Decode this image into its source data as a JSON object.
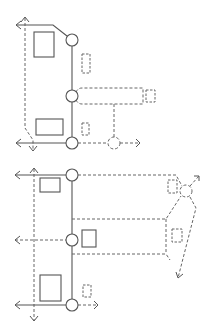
{
  "diagram": {
    "colors": {
      "background": "#ffffff",
      "stroke": "#555555",
      "dashed_stroke": "#666666"
    },
    "top_plan": {
      "nodes": [
        {
          "id": "t-node-1",
          "cx": 72,
          "cy": 40,
          "r": 6,
          "style": "solid"
        },
        {
          "id": "t-node-2",
          "cx": 72,
          "cy": 96,
          "r": 6,
          "style": "solid"
        },
        {
          "id": "t-node-3",
          "cx": 72,
          "cy": 143,
          "r": 6,
          "style": "solid"
        },
        {
          "id": "t-node-4",
          "cx": 114,
          "cy": 143,
          "r": 6,
          "style": "dashed"
        }
      ],
      "solid_boxes": [
        {
          "id": "t-box-1",
          "x": 34,
          "y": 32,
          "w": 20,
          "h": 25
        },
        {
          "id": "t-box-2",
          "x": 36,
          "y": 119,
          "w": 27,
          "h": 16
        }
      ],
      "dashed_boxes": [
        {
          "id": "t-dbox-1",
          "x": 82,
          "y": 54,
          "w": 8,
          "h": 19
        },
        {
          "id": "t-dbox-2",
          "x": 82,
          "y": 123,
          "w": 7,
          "h": 12
        },
        {
          "id": "t-dbox-3",
          "x": 146,
          "y": 90,
          "w": 9,
          "h": 12
        }
      ],
      "arrows": [
        "up",
        "left",
        "left",
        "down",
        "right"
      ]
    },
    "bottom_plan": {
      "nodes": [
        {
          "id": "b-node-1",
          "cx": 72,
          "cy": 175,
          "r": 6,
          "style": "solid"
        },
        {
          "id": "b-node-2",
          "cx": 72,
          "cy": 240,
          "r": 6,
          "style": "solid"
        },
        {
          "id": "b-node-3",
          "cx": 72,
          "cy": 305,
          "r": 6,
          "style": "solid"
        },
        {
          "id": "b-node-4",
          "cx": 186,
          "cy": 191,
          "r": 6,
          "style": "dashed"
        }
      ],
      "solid_boxes": [
        {
          "id": "b-box-1",
          "x": 40,
          "y": 178,
          "w": 20,
          "h": 14
        },
        {
          "id": "b-box-2",
          "x": 82,
          "y": 230,
          "w": 14,
          "h": 17
        },
        {
          "id": "b-box-3",
          "x": 40,
          "y": 275,
          "w": 21,
          "h": 26
        }
      ],
      "dashed_boxes": [
        {
          "id": "b-dbox-1",
          "x": 83,
          "y": 285,
          "w": 8,
          "h": 12
        },
        {
          "id": "b-dbox-2",
          "x": 168,
          "y": 180,
          "w": 9,
          "h": 13
        },
        {
          "id": "b-dbox-3",
          "x": 172,
          "y": 229,
          "w": 10,
          "h": 13
        }
      ],
      "arrows": [
        "up",
        "left",
        "left",
        "left",
        "down",
        "right",
        "up-right",
        "down-left"
      ]
    }
  }
}
